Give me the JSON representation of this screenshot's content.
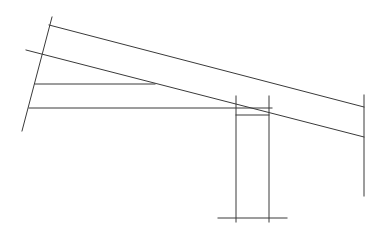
{
  "diagram": {
    "title": "",
    "stroke_color": "#3a3a3a",
    "background_color": "#ffffff",
    "labels": []
  }
}
